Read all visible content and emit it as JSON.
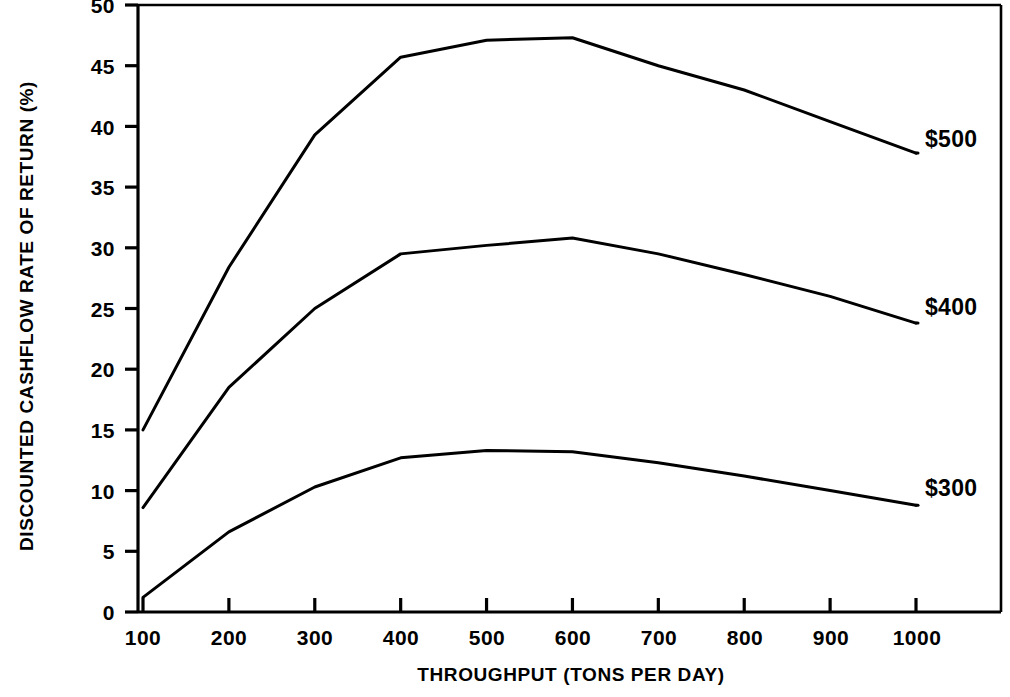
{
  "chart_data": {
    "type": "line",
    "title": "",
    "xlabel": "THROUGHPUT (TONS PER DAY)",
    "ylabel": "DISCOUNTED CASHFLOW RATE OF RETURN (%)",
    "xlim": [
      100,
      1000
    ],
    "ylim": [
      0,
      50
    ],
    "grid": false,
    "legend_position": "right-inline-labels",
    "x": [
      100,
      200,
      300,
      400,
      500,
      600,
      700,
      800,
      900,
      1000
    ],
    "xticks": [
      "100",
      "200",
      "300",
      "400",
      "500",
      "600",
      "700",
      "800",
      "900",
      "1000"
    ],
    "yticks": [
      "0",
      "5",
      "10",
      "15",
      "20",
      "25",
      "30",
      "35",
      "40",
      "45",
      "50"
    ],
    "series": [
      {
        "name": "$500",
        "label": "$500",
        "color": "#000000",
        "values": [
          15.0,
          28.4,
          39.3,
          45.7,
          47.1,
          47.3,
          45.0,
          43.0,
          40.4,
          37.8
        ]
      },
      {
        "name": "$400",
        "label": "$400",
        "color": "#000000",
        "values": [
          8.6,
          18.5,
          25.0,
          29.5,
          30.2,
          30.8,
          29.5,
          27.8,
          26.0,
          23.8
        ]
      },
      {
        "name": "$300",
        "label": "$300",
        "color": "#000000",
        "values": [
          1.2,
          6.6,
          10.3,
          12.7,
          13.3,
          13.2,
          12.3,
          11.2,
          10.0,
          8.8
        ]
      }
    ]
  },
  "axes": {
    "y_tick_values": [
      50,
      45,
      40,
      35,
      30,
      25,
      20,
      15,
      10,
      5,
      0
    ],
    "x_tick_values": [
      100,
      200,
      300,
      400,
      500,
      600,
      700,
      800,
      900,
      1000
    ]
  },
  "style": {
    "line_color": "#000000",
    "axis_color": "#000000",
    "background": "#ffffff"
  }
}
